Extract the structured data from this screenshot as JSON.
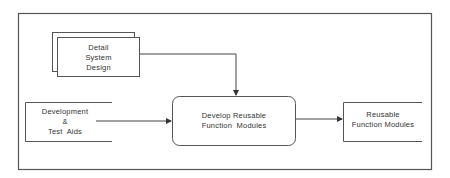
{
  "diagram": {
    "type": "flow",
    "nodes": [
      {
        "id": "detail-system-design",
        "shape": "stacked-document",
        "lines": [
          "Detail",
          "System",
          "Design"
        ]
      },
      {
        "id": "development-test-aids",
        "shape": "open-data-store",
        "lines": [
          "Development",
          "&",
          "Test  Aids"
        ]
      },
      {
        "id": "develop-reusable-function-modules",
        "shape": "rounded-process",
        "lines": [
          "Develop Reusable",
          "Function  Modules"
        ]
      },
      {
        "id": "reusable-function-modules",
        "shape": "open-data-store",
        "lines": [
          "Reusable",
          "Function Modules"
        ]
      }
    ],
    "edges": [
      {
        "from": "detail-system-design",
        "to": "develop-reusable-function-modules"
      },
      {
        "from": "development-test-aids",
        "to": "develop-reusable-function-modules"
      },
      {
        "from": "develop-reusable-function-modules",
        "to": "reusable-function-modules"
      }
    ],
    "colors": {
      "line": "#4a4a4a",
      "text": "#333333",
      "background": "#ffffff"
    }
  }
}
